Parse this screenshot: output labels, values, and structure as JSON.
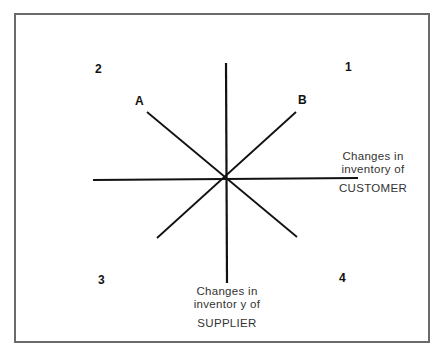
{
  "quadrants": {
    "q1": "1",
    "q2": "2",
    "q3": "3",
    "q4": "4"
  },
  "lines": {
    "a_label": "A",
    "b_label": "B"
  },
  "x_axis": {
    "line1": "Changes in",
    "line2": "inventory of",
    "line3": "CUSTOMER"
  },
  "y_axis": {
    "line1": "Changes in",
    "line2": "inventor y of",
    "line3": "SUPPLIER"
  },
  "colors": {
    "line": "#111111",
    "frame": "#6a6a6a"
  }
}
